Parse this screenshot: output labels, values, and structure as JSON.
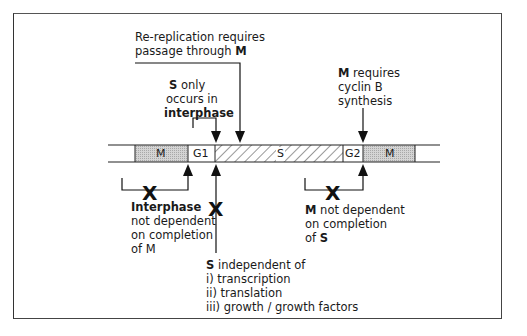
{
  "diagram": {
    "bar": {
      "segments": [
        {
          "label": "",
          "type": "blank"
        },
        {
          "label": "M",
          "type": "stipple"
        },
        {
          "label": "G1",
          "type": "blank"
        },
        {
          "label": "S",
          "type": "hatched"
        },
        {
          "label": "G2",
          "type": "blank"
        },
        {
          "label": "M",
          "type": "stipple"
        },
        {
          "label": "",
          "type": "blank"
        }
      ]
    },
    "annotations": {
      "rereplication": {
        "line1": "Re-replication requires",
        "line2_prefix": "passage through ",
        "line2_bold": "M"
      },
      "s_only": {
        "line1_bold": "S",
        "line1_rest": " only",
        "line2": "occurs in",
        "line3_bold": "interphase"
      },
      "m_requires": {
        "line1_bold": "M",
        "line1_rest": " requires",
        "line2": "cyclin B",
        "line3": "synthesis"
      },
      "interphase_independent": {
        "line1_bold": "Interphase",
        "line2": "not dependent",
        "line3": "on completion",
        "line4": "of M"
      },
      "m_independent": {
        "line1_bold": "M",
        "line1_rest": " not dependent",
        "line2": "on completion",
        "line3_prefix": "of ",
        "line3_bold": "S"
      },
      "s_independent": {
        "line1_bold": "S",
        "line1_rest": " independent of",
        "items": [
          "i) transcription",
          "ii) translation",
          "iii) growth / growth factors"
        ]
      }
    },
    "symbols": {
      "block_mark": "X"
    },
    "colors": {
      "stipple": "#c8c8c8",
      "line": "#111111",
      "frame": "#444444"
    }
  }
}
